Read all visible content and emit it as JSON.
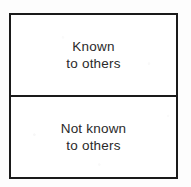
{
  "diagram": {
    "type": "two-row-labeled-box",
    "background_color": "#fdfdfd",
    "border_color": "#1a1a1a",
    "fill_color": "#ffffff",
    "text_color": "#2a2a2a",
    "cells": [
      {
        "id": "known-to-others",
        "line1": "Known",
        "line2": "to others"
      },
      {
        "id": "not-known-to-others",
        "line1": "Not known",
        "line2": "to others"
      }
    ]
  }
}
